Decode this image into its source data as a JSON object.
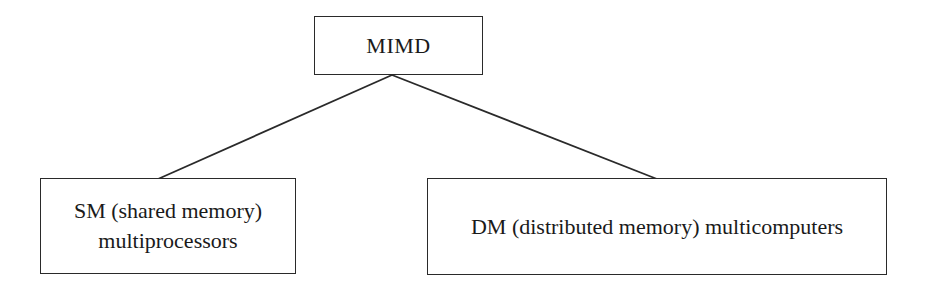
{
  "diagram": {
    "type": "tree",
    "root": {
      "id": "mimd",
      "label": "MIMD"
    },
    "children": [
      {
        "id": "sm",
        "label_lines": [
          "SM (shared memory)",
          "multiprocessors"
        ]
      },
      {
        "id": "dm",
        "label_lines": [
          "DM (distributed memory) multicomputers"
        ]
      }
    ],
    "edges": [
      {
        "from": "mimd",
        "to": "sm"
      },
      {
        "from": "mimd",
        "to": "dm"
      }
    ],
    "colors": {
      "stroke": "#2a2a2a",
      "text": "#1a1a1a",
      "background": "#ffffff"
    }
  }
}
